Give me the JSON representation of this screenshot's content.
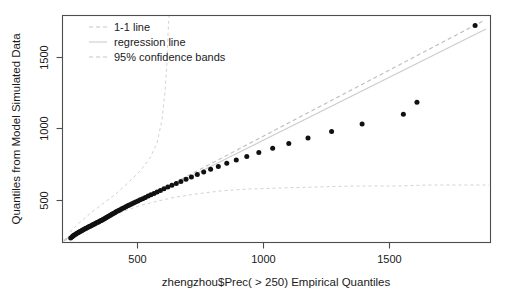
{
  "chart_data": {
    "type": "scatter",
    "title": "",
    "xlabel": "zhengzhou$Prec( > 250) Empirical Quantiles",
    "ylabel": "Quantiles from Model Simulated Data",
    "xlim": [
      230,
      1900
    ],
    "ylim": [
      240,
      1830
    ],
    "xticks": [
      500,
      1000,
      1500
    ],
    "xtick_labels": [
      "500",
      "1000",
      "1500"
    ],
    "yticks": [
      500,
      1000,
      1500
    ],
    "ytick_labels": [
      "500",
      "1000",
      "1500"
    ],
    "grid": false,
    "legend_position": "top-left",
    "legend": [
      {
        "label": "1-1 line",
        "style": "dashed",
        "color": "#bdbdbd"
      },
      {
        "label": "regression line",
        "style": "solid",
        "color": "#cccccc"
      },
      {
        "label": "95% confidence bands",
        "style": "dashed",
        "color": "#d2d2d2"
      }
    ],
    "series": [
      {
        "name": "qq-points",
        "marker": "filled-circle",
        "color": "#111111",
        "points": [
          [
            262,
            272
          ],
          [
            268,
            281
          ],
          [
            272,
            287
          ],
          [
            276,
            292
          ],
          [
            281,
            297
          ],
          [
            285,
            303
          ],
          [
            290,
            308
          ],
          [
            294,
            312
          ],
          [
            298,
            317
          ],
          [
            303,
            321
          ],
          [
            307,
            325
          ],
          [
            311,
            330
          ],
          [
            316,
            334
          ],
          [
            320,
            338
          ],
          [
            324,
            342
          ],
          [
            329,
            346
          ],
          [
            333,
            350
          ],
          [
            337,
            354
          ],
          [
            342,
            358
          ],
          [
            346,
            362
          ],
          [
            350,
            366
          ],
          [
            355,
            370
          ],
          [
            359,
            374
          ],
          [
            363,
            378
          ],
          [
            368,
            382
          ],
          [
            372,
            386
          ],
          [
            376,
            390
          ],
          [
            381,
            394
          ],
          [
            385,
            398
          ],
          [
            389,
            403
          ],
          [
            394,
            407
          ],
          [
            398,
            412
          ],
          [
            403,
            417
          ],
          [
            408,
            422
          ],
          [
            413,
            428
          ],
          [
            418,
            433
          ],
          [
            423,
            438
          ],
          [
            428,
            444
          ],
          [
            434,
            449
          ],
          [
            439,
            455
          ],
          [
            445,
            460
          ],
          [
            451,
            466
          ],
          [
            457,
            472
          ],
          [
            463,
            478
          ],
          [
            470,
            484
          ],
          [
            477,
            490
          ],
          [
            484,
            497
          ],
          [
            491,
            503
          ],
          [
            499,
            510
          ],
          [
            507,
            517
          ],
          [
            515,
            524
          ],
          [
            524,
            531
          ],
          [
            533,
            539
          ],
          [
            543,
            547
          ],
          [
            553,
            556
          ],
          [
            564,
            565
          ],
          [
            575,
            574
          ],
          [
            587,
            584
          ],
          [
            599,
            594
          ],
          [
            612,
            605
          ],
          [
            626,
            616
          ],
          [
            641,
            628
          ],
          [
            657,
            641
          ],
          [
            674,
            654
          ],
          [
            692,
            668
          ],
          [
            712,
            683
          ],
          [
            733,
            699
          ],
          [
            756,
            716
          ],
          [
            781,
            734
          ],
          [
            808,
            753
          ],
          [
            838,
            773
          ],
          [
            871,
            795
          ],
          [
            908,
            818
          ],
          [
            949,
            843
          ],
          [
            996,
            870
          ],
          [
            1050,
            900
          ],
          [
            1113,
            934
          ],
          [
            1188,
            972
          ],
          [
            1280,
            1017
          ],
          [
            1399,
            1070
          ],
          [
            1560,
            1138
          ],
          [
            1613,
            1222
          ],
          [
            1840,
            1760
          ]
        ]
      }
    ],
    "reference_lines": [
      {
        "name": "1-1 line",
        "style": "dashed",
        "from": [
          240,
          240
        ],
        "to": [
          1880,
          1880
        ]
      },
      {
        "name": "regression line",
        "style": "solid",
        "from": [
          240,
          248
        ],
        "to": [
          1880,
          1768
        ]
      }
    ],
    "confidence_bands": {
      "name": "95% confidence bands",
      "upper": [
        [
          250,
          258
        ],
        [
          330,
          348
        ],
        [
          420,
          430
        ],
        [
          500,
          510
        ],
        [
          560,
          600
        ],
        [
          600,
          760
        ],
        [
          625,
          1050
        ],
        [
          640,
          1400
        ],
        [
          650,
          1830
        ]
      ],
      "lower": [
        [
          250,
          252
        ],
        [
          330,
          330
        ],
        [
          420,
          395
        ],
        [
          520,
          455
        ],
        [
          640,
          500
        ],
        [
          800,
          540
        ],
        [
          1000,
          562
        ],
        [
          1300,
          575
        ],
        [
          1600,
          580
        ],
        [
          1880,
          585
        ]
      ]
    }
  },
  "axis": {
    "x_title": "zhengzhou$Prec( > 250) Empirical Quantiles",
    "y_title": "Quantiles from Model Simulated Data"
  }
}
